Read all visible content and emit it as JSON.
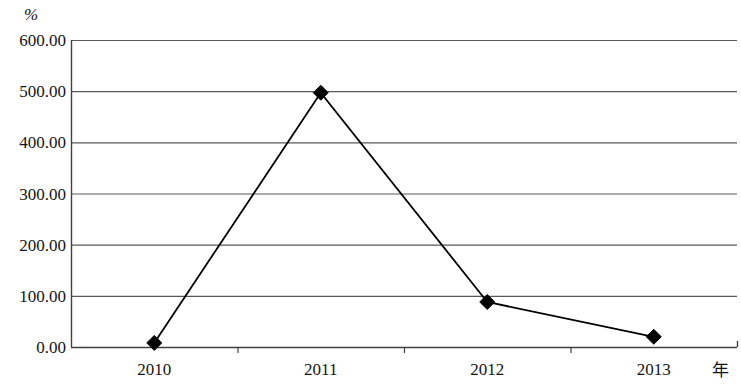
{
  "chart_data": {
    "type": "line",
    "title": "",
    "subtitle": "",
    "xlabel": "年",
    "ylabel": "%",
    "categories": [
      "2010",
      "2011",
      "2012",
      "2013"
    ],
    "values": [
      8.0,
      497.0,
      88.0,
      20.0
    ],
    "series": [
      {
        "name": "",
        "values": [
          8.0,
          497.0,
          88.0,
          20.0
        ]
      }
    ],
    "ylim": [
      0,
      600
    ],
    "ytick_values": [
      0,
      100,
      200,
      300,
      400,
      500,
      600
    ],
    "ytick_labels": [
      "0.00",
      "100.00",
      "200.00",
      "300.00",
      "400.00",
      "500.00",
      "600.00"
    ],
    "grid": "horizontal",
    "legend": "none",
    "marker": "diamond",
    "line_color": "#000000",
    "marker_color": "#000000",
    "grid_color": "#595959",
    "axis_color": "#404040",
    "background": "#ffffff"
  },
  "axes": {
    "y_unit": "%",
    "x_unit": "年"
  }
}
